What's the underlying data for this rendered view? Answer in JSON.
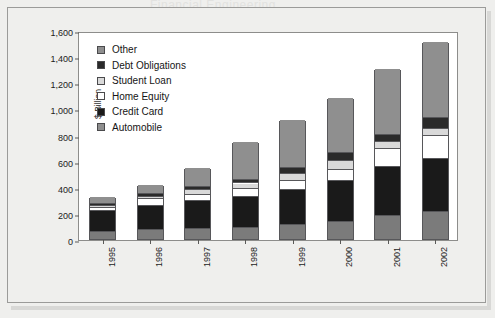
{
  "figure": {
    "header_bleed_text": "Financial Engineering"
  },
  "chart_data": {
    "type": "bar",
    "subtype": "stacked-vertical",
    "title": "",
    "xlabel": "",
    "ylabel": "$ Billion",
    "ylim": [
      0,
      1600
    ],
    "ytick_step": 200,
    "ytick_labels": [
      "1,600",
      "1,400",
      "1,200",
      "1,000",
      "800",
      "600",
      "400",
      "200",
      "0"
    ],
    "ytick_values": [
      1600,
      1400,
      1200,
      1000,
      800,
      600,
      400,
      200,
      0
    ],
    "grid": false,
    "legend_position": "upper-left-inside",
    "stack_order_bottom_to_top": [
      "Automobile",
      "Credit Card",
      "Home Equity",
      "Student Loan",
      "Debt Obligations",
      "Other"
    ],
    "categories": [
      "1995",
      "1996",
      "1997",
      "1998",
      "1999",
      "2000",
      "2001",
      "2002"
    ],
    "series": [
      {
        "name": "Automobile",
        "color": "#7b7b7b",
        "values": [
          50,
          70,
          75,
          85,
          110,
          130,
          180,
          210
        ]
      },
      {
        "name": "Credit Card",
        "color": "#1a1a1a",
        "values": [
          165,
          185,
          215,
          240,
          265,
          315,
          375,
          400
        ]
      },
      {
        "name": "Home Equity",
        "color": "#ffffff",
        "values": [
          20,
          50,
          50,
          55,
          70,
          85,
          135,
          180
        ]
      },
      {
        "name": "Student Loan",
        "color": "#d9d9d9",
        "values": [
          15,
          20,
          35,
          45,
          55,
          65,
          50,
          55
        ]
      },
      {
        "name": "Debt Obligations",
        "color": "#2a2a2a",
        "values": [
          15,
          20,
          25,
          30,
          45,
          60,
          60,
          85
        ]
      },
      {
        "name": "Other",
        "color": "#8f8f8f",
        "values": [
          55,
          70,
          140,
          285,
          365,
          425,
          505,
          575
        ]
      }
    ],
    "totals": [
      320,
      415,
      540,
      740,
      910,
      1080,
      1305,
      1505
    ]
  },
  "legend": {
    "items": [
      {
        "label": "Other",
        "color": "#8f8f8f"
      },
      {
        "label": "Debt Obligations",
        "color": "#2a2a2a"
      },
      {
        "label": "Student Loan",
        "color": "#d9d9d9"
      },
      {
        "label": "Home Equity",
        "color": "#ffffff"
      },
      {
        "label": "Credit Card",
        "color": "#1a1a1a"
      },
      {
        "label": "Automobile",
        "color": "#8f8f8f"
      }
    ]
  }
}
